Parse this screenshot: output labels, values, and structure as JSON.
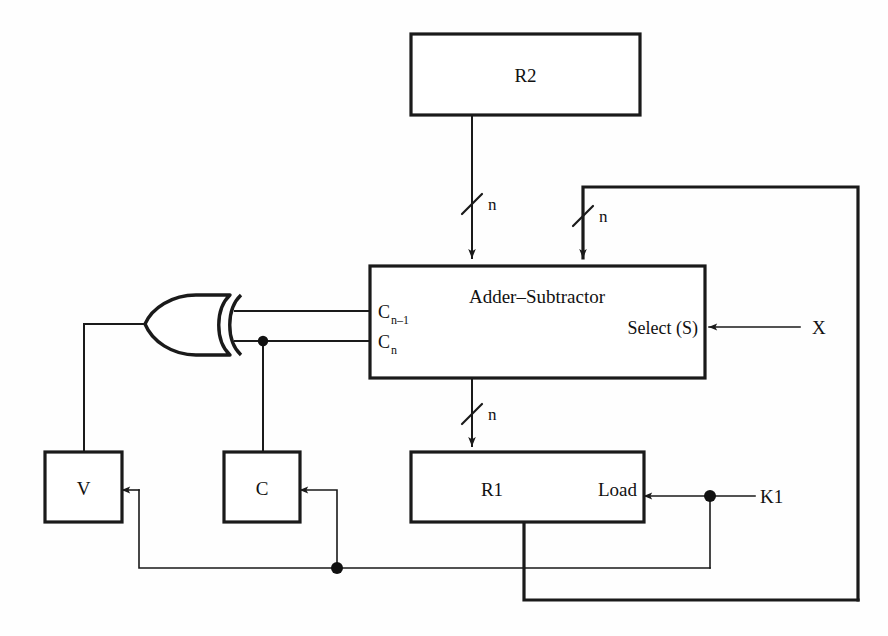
{
  "diagram": {
    "bus_width_symbol": "n",
    "stroke_color": "#1a1a1a",
    "background_color": "#ffffff"
  },
  "blocks": {
    "r2": {
      "label": "R2"
    },
    "adder_subtractor": {
      "label": "Adder–Subtractor",
      "port_carry_in_base": "C",
      "port_carry_in_sub": "n–1",
      "port_carry_out_base": "C",
      "port_carry_out_sub": "n",
      "select_label": "Select (S)"
    },
    "v_flag": {
      "label": "V"
    },
    "c_flag": {
      "label": "C"
    },
    "r1": {
      "label": "R1",
      "load_label": "Load"
    }
  },
  "signals": {
    "select_input": "X",
    "load_input": "K1",
    "bus_r2_to_adder": "n",
    "bus_feedback_to_adder": "n",
    "bus_adder_to_r1": "n"
  },
  "gates": {
    "xor": {
      "type": "xor-gate",
      "name": "overflow-xor"
    }
  },
  "junctions": [
    {
      "name": "carry-out-tap",
      "x": 263,
      "y": 341
    },
    {
      "name": "lower-bus-tap",
      "x": 337,
      "y": 568
    },
    {
      "name": "k1-tap",
      "x": 710,
      "y": 496
    }
  ]
}
